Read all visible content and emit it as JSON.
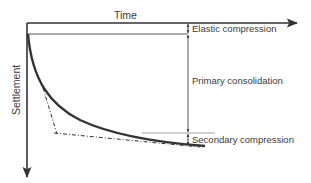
{
  "diagram": {
    "axes": {
      "x_label": "Time",
      "y_label": "Settlement"
    },
    "annotations": {
      "elastic": "Elastic compression",
      "primary": "Primary consolidation",
      "secondary": "Secondary compression"
    },
    "colors": {
      "axis": "#333333",
      "curve": "#333333",
      "guide": "#a0a0a0",
      "text": "#3a3a3a"
    }
  }
}
